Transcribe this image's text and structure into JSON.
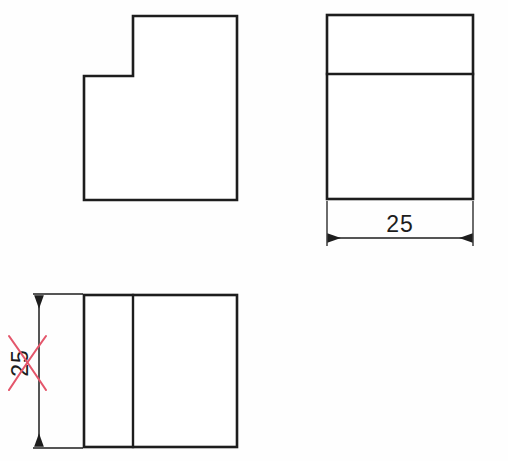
{
  "drawing": {
    "title": "Orthographic multiview sketch",
    "background_color": "#fefefe",
    "line_color": "#1d1d1d",
    "markup_color": "#e4566b"
  },
  "views": {
    "front": {
      "name": "front-view-l-shape",
      "description": "L-shaped profile with notch at upper left",
      "outline_points": "133,16 237,16 237,200 84,200 84,76 133,76 133,16"
    },
    "right": {
      "name": "right-side-view-rectangle",
      "description": "Rectangle divided by one horizontal line near top",
      "rect": {
        "x": 327,
        "y": 15,
        "width": 146,
        "height": 184
      },
      "divider_y": 74
    },
    "top": {
      "name": "top-view-rectangle",
      "description": "Rectangle divided by one vertical line near left",
      "rect": {
        "x": 84,
        "y": 295,
        "width": 153,
        "height": 152
      },
      "divider_x": 133
    }
  },
  "dimensions": {
    "horizontal": {
      "name": "width-dimension",
      "value": "25",
      "orientation": "horizontal",
      "crossed_out": false
    },
    "vertical": {
      "name": "depth-dimension",
      "value": "25",
      "orientation": "vertical",
      "crossed_out": true,
      "markup": "red-x-cross-out"
    }
  }
}
